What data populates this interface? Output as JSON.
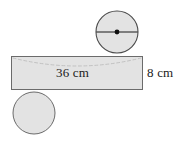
{
  "figure": {
    "background_color": "#ffffff",
    "shape_fill": "#e3e3e3",
    "shape_stroke": "#6b6b6b",
    "line_color": "#1a1a1a",
    "arc_color": "#bdbdbd",
    "text_color": "#1a1a1a"
  },
  "labels": {
    "width": "36 cm",
    "height": "8 cm"
  },
  "parts": {
    "top_circle": {
      "name": "top-circle",
      "cx": 117,
      "cy": 32,
      "r": 21,
      "has_diameter_line": true,
      "has_center_dot": true
    },
    "bottom_circle": {
      "name": "bottom-circle",
      "cx": 34,
      "cy": 113,
      "r": 21,
      "has_diameter_line": false,
      "has_center_dot": false
    },
    "rectangle": {
      "name": "lateral-rectangle",
      "x": 11,
      "y": 56,
      "width": 132,
      "height": 34
    }
  },
  "measurements": {
    "rectangle_length_cm": 36,
    "rectangle_height_cm": 8
  }
}
